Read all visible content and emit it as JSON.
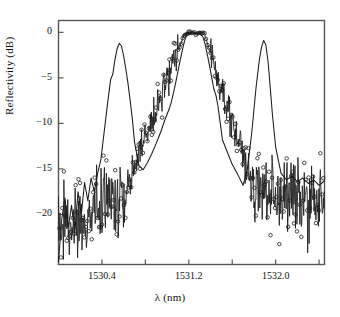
{
  "figure": {
    "kind": "scientific-line-plot",
    "background_color": "#ffffff",
    "line_color": "#1a1a1a",
    "marker_color": "#1a1a1a"
  },
  "axes": {
    "x_title": "λ (nm)",
    "y_title": "Reflectivity (dB)",
    "x_tick_labels": [
      "1530.4",
      "1531.2",
      "1532.0"
    ],
    "y_tick_labels": [
      "0",
      "−5",
      "−10",
      "−15",
      "−20"
    ]
  },
  "chart_data": {
    "type": "line",
    "title": "",
    "xlabel": "λ (nm)",
    "ylabel": "Reflectivity (dB)",
    "xlim": [
      1530.0,
      1532.45
    ],
    "ylim": [
      -25.5,
      1.3
    ],
    "xticks": [
      1530.0,
      1530.4,
      1530.8,
      1531.2,
      1531.6,
      1532.0,
      1532.4
    ],
    "xticklabels": [
      "",
      "1530.4",
      "",
      "1531.2",
      "",
      "1532.0",
      ""
    ],
    "yticks": [
      0,
      -5,
      -10,
      -15,
      -20
    ],
    "yticklabels": [
      "0",
      "−5",
      "−10",
      "−15",
      "−20"
    ],
    "grid": false,
    "legend": "none",
    "series": [
      {
        "name": "theoretical",
        "style": "solid-line",
        "marker": "none",
        "x": [
          1530.0,
          1530.03,
          1530.06,
          1530.09,
          1530.12,
          1530.15,
          1530.18,
          1530.21,
          1530.24,
          1530.27,
          1530.3,
          1530.33,
          1530.36,
          1530.39,
          1530.42,
          1530.45,
          1530.48,
          1530.5,
          1530.52,
          1530.54,
          1530.56,
          1530.58,
          1530.6,
          1530.62,
          1530.64,
          1530.66,
          1530.68,
          1530.7,
          1530.74,
          1530.78,
          1530.82,
          1530.86,
          1530.9,
          1530.94,
          1530.98,
          1531.0,
          1531.02,
          1531.04,
          1531.06,
          1531.08,
          1531.1,
          1531.12,
          1531.14,
          1531.16,
          1531.18,
          1531.22,
          1531.26,
          1531.3,
          1531.33,
          1531.35,
          1531.37,
          1531.39,
          1531.41,
          1531.43,
          1531.45,
          1531.47,
          1531.49,
          1531.51,
          1531.55,
          1531.6,
          1531.65,
          1531.7,
          1531.74,
          1531.78,
          1531.82,
          1531.85,
          1531.87,
          1531.89,
          1531.91,
          1531.93,
          1531.95,
          1531.97,
          1532.0,
          1532.05,
          1532.1,
          1532.15,
          1532.2,
          1532.25,
          1532.3,
          1532.35,
          1532.4,
          1532.45
        ],
        "y": [
          -25.2,
          -20.5,
          -18.2,
          -21.5,
          -19.0,
          -22.0,
          -17.5,
          -20.0,
          -16.5,
          -18.5,
          -16.0,
          -17.5,
          -15.5,
          -14.0,
          -11.0,
          -8.0,
          -5.2,
          -4.6,
          -3.0,
          -1.8,
          -1.2,
          -1.5,
          -2.6,
          -4.0,
          -5.6,
          -7.5,
          -9.5,
          -12.0,
          -14.6,
          -15.1,
          -14.3,
          -13.3,
          -12.2,
          -11.0,
          -9.6,
          -9.0,
          -8.4,
          -7.6,
          -6.6,
          -5.5,
          -4.3,
          -3.1,
          -2.0,
          -1.0,
          -0.3,
          -0.05,
          -0.05,
          -0.1,
          -0.5,
          -1.3,
          -2.4,
          -3.6,
          -4.9,
          -6.2,
          -6.9,
          -8.2,
          -10.0,
          -11.8,
          -13.0,
          -14.5,
          -15.6,
          -16.8,
          -15.0,
          -11.0,
          -6.0,
          -3.0,
          -1.6,
          -0.9,
          -1.4,
          -3.2,
          -6.0,
          -9.0,
          -12.6,
          -15.5,
          -16.2,
          -15.8,
          -16.4,
          -16.0,
          -16.6,
          -16.2,
          -16.8,
          -16.3
        ]
      },
      {
        "name": "measured",
        "style": "noisy-line-with-open-circle-markers",
        "marker": "o",
        "note": "Open circle markers track the noisy measured reflectivity spectrum."
      }
    ],
    "features": {
      "center_peak": {
        "flat_top_dB": 0.0,
        "span_nm": [
          1531.18,
          1531.33
        ]
      },
      "left_sidelobe": {
        "peak_dB": -1.2,
        "center_nm": 1530.56
      },
      "right_sidelobe": {
        "peak_dB": -0.9,
        "center_nm": 1531.89
      },
      "noise_floor_dB": [
        -23,
        -15
      ]
    }
  }
}
